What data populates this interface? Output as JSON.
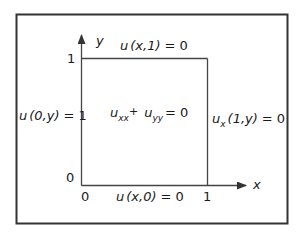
{
  "diagram": {
    "axes": {
      "x_label": "x",
      "y_label": "y",
      "origin_x_tick": "0",
      "origin_y_tick": "0",
      "x_tick_1": "1",
      "y_tick_1": "1"
    },
    "pde": {
      "u1": "u",
      "sub1": "xx",
      "plus": "+",
      "u2": "u",
      "sub2": "yy",
      "rhs": "= 0"
    },
    "boundary_conditions": {
      "top": {
        "func": "u",
        "args": "(x,1)",
        "rhs": "= 0"
      },
      "left": {
        "func": "u",
        "args": "(0,y)",
        "rhs": "= 1"
      },
      "right": {
        "func": "u",
        "sub": "x",
        "args": "(1,y)",
        "rhs": "= 0"
      },
      "bottom": {
        "func": "u",
        "args": "(x,0)",
        "rhs": "= 0"
      }
    },
    "colors": {
      "frame": "#333333",
      "lines": "#444444",
      "text": "#1a1a1a",
      "background": "#ffffff"
    }
  }
}
